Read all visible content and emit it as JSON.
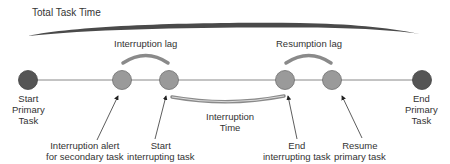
{
  "diagram": {
    "title": "Total Task Time",
    "arcs": {
      "interruption_lag": "Interruption lag",
      "resumption_lag": "Resumption lag",
      "interruption_time": [
        "Interruption",
        "Time"
      ]
    },
    "nodes": [
      {
        "id": "start-primary",
        "label": [
          "Start",
          "Primary",
          "Task"
        ],
        "color": "#555555"
      },
      {
        "id": "interruption-alert",
        "label": [
          "Interruption alert",
          "for secondary task"
        ],
        "color": "#9a9a9a"
      },
      {
        "id": "start-interrupting",
        "label": [
          "Start",
          "interrupting task"
        ],
        "color": "#9a9a9a"
      },
      {
        "id": "end-interrupting",
        "label": [
          "End",
          "interrupting task"
        ],
        "color": "#9a9a9a"
      },
      {
        "id": "resume-primary",
        "label": [
          "Resume",
          "primary task"
        ],
        "color": "#9a9a9a"
      },
      {
        "id": "end-primary",
        "label": [
          "End",
          "Primary",
          "Task"
        ],
        "color": "#555555"
      }
    ],
    "colors": {
      "total_bar": "#4a4a4a",
      "arc": "#8a8a8a",
      "line": "#888888"
    }
  }
}
